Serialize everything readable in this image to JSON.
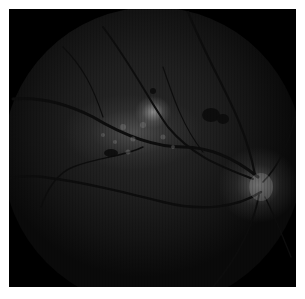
{
  "image": {
    "subject": "retinal fundus photograph",
    "background_color": "#ffffff",
    "frame_color": "#000000",
    "features": [
      {
        "name": "optic-disc",
        "position": "right-center",
        "color": "#9a9a9a"
      },
      {
        "name": "macular-lesion",
        "position": "center",
        "color": "#b0b0b0"
      },
      {
        "name": "dark-spots",
        "position": "upper-right of lesion",
        "color": "#0c0c0c"
      },
      {
        "name": "retinal-vessels",
        "color": "#0e0e0e"
      }
    ]
  }
}
